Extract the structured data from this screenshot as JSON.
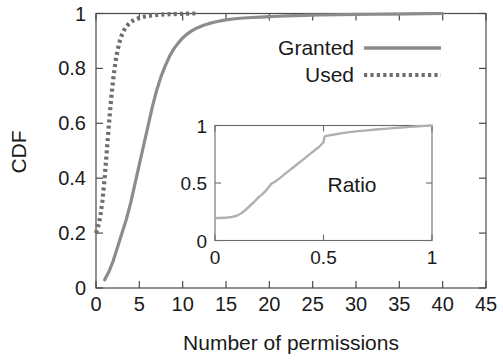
{
  "chart_data": {
    "type": "line",
    "title": "",
    "xlabel": "Number of permissions",
    "ylabel": "CDF",
    "xlim": [
      0,
      45
    ],
    "ylim": [
      0,
      1
    ],
    "xticks": [
      "0",
      "5",
      "10",
      "15",
      "20",
      "25",
      "30",
      "35",
      "40",
      "45"
    ],
    "xtick_values": [
      0,
      5,
      10,
      15,
      20,
      25,
      30,
      35,
      40,
      45
    ],
    "yticks": [
      "0",
      "0.2",
      "0.4",
      "0.6",
      "0.8",
      "1"
    ],
    "ytick_values": [
      0,
      0.2,
      0.4,
      0.6,
      0.8,
      1
    ],
    "grid": false,
    "legend_position": "upper right",
    "series": [
      {
        "name": "Granted",
        "style": "solid",
        "color": "#8c8c8c",
        "x": [
          1,
          1.5,
          2,
          2.5,
          3,
          3.5,
          4,
          4.5,
          5,
          5.5,
          6,
          6.5,
          7,
          7.5,
          8,
          8.5,
          9,
          9.5,
          10,
          10.5,
          11,
          11.5,
          12,
          12.5,
          13,
          13.5,
          14,
          14.5,
          15,
          16,
          17,
          18,
          19,
          20,
          21,
          22,
          23,
          24,
          25,
          26,
          28,
          30,
          32,
          34,
          36,
          38,
          40
        ],
        "y": [
          0.03,
          0.06,
          0.1,
          0.15,
          0.2,
          0.25,
          0.31,
          0.38,
          0.45,
          0.52,
          0.59,
          0.66,
          0.72,
          0.77,
          0.81,
          0.845,
          0.872,
          0.893,
          0.911,
          0.925,
          0.936,
          0.945,
          0.952,
          0.958,
          0.963,
          0.967,
          0.971,
          0.974,
          0.977,
          0.981,
          0.9835,
          0.9855,
          0.987,
          0.9885,
          0.99,
          0.991,
          0.992,
          0.993,
          0.9938,
          0.9945,
          0.9955,
          0.9965,
          0.9972,
          0.998,
          0.9987,
          0.9993,
          1.0
        ]
      },
      {
        "name": "Used",
        "style": "dotted",
        "color": "#6e6e6e",
        "x": [
          0,
          0.25,
          0.5,
          0.75,
          1,
          1.25,
          1.5,
          1.75,
          2,
          2.25,
          2.5,
          2.75,
          3,
          3.25,
          3.5,
          3.75,
          4,
          4.25,
          4.5,
          5,
          5.5,
          6,
          6.5,
          7,
          7.5,
          8,
          8.5,
          9,
          9.5,
          10,
          10.5,
          11,
          11.5
        ],
        "y": [
          0.2,
          0.225,
          0.26,
          0.32,
          0.4,
          0.5,
          0.6,
          0.69,
          0.765,
          0.825,
          0.868,
          0.9,
          0.924,
          0.94,
          0.952,
          0.961,
          0.968,
          0.974,
          0.978,
          0.984,
          0.988,
          0.991,
          0.993,
          0.9945,
          0.996,
          0.9968,
          0.9975,
          0.998,
          0.9985,
          0.999,
          0.9995,
          1.0,
          1.0
        ]
      }
    ],
    "inset": {
      "type": "line",
      "title": "Ratio",
      "xlim": [
        0,
        1
      ],
      "ylim": [
        0,
        1
      ],
      "xticks": [
        "0",
        "0.5",
        "1"
      ],
      "xtick_values": [
        0,
        0.5,
        1
      ],
      "yticks": [
        "0",
        "0.5",
        "1"
      ],
      "ytick_values": [
        0,
        0.5,
        1
      ],
      "grid": false,
      "series": [
        {
          "name": "Ratio",
          "style": "solid",
          "color": "#b0b0b0",
          "x": [
            0.0,
            0.02,
            0.04,
            0.06,
            0.08,
            0.1,
            0.12,
            0.14,
            0.16,
            0.18,
            0.2,
            0.22,
            0.24,
            0.25,
            0.26,
            0.28,
            0.3,
            0.32,
            0.34,
            0.36,
            0.38,
            0.4,
            0.42,
            0.44,
            0.46,
            0.48,
            0.49,
            0.5,
            0.505,
            0.52,
            0.55,
            0.58,
            0.62,
            0.66,
            0.7,
            0.74,
            0.78,
            0.82,
            0.86,
            0.9,
            0.94,
            0.97,
            1.0
          ],
          "y": [
            0.195,
            0.196,
            0.198,
            0.2,
            0.205,
            0.215,
            0.235,
            0.265,
            0.3,
            0.335,
            0.375,
            0.405,
            0.445,
            0.47,
            0.495,
            0.515,
            0.545,
            0.575,
            0.605,
            0.635,
            0.665,
            0.695,
            0.725,
            0.755,
            0.785,
            0.815,
            0.835,
            0.855,
            0.905,
            0.912,
            0.922,
            0.932,
            0.942,
            0.951,
            0.958,
            0.965,
            0.971,
            0.977,
            0.982,
            0.988,
            0.993,
            0.997,
            1.0
          ]
        }
      ]
    }
  },
  "legend": {
    "items": [
      {
        "label": "Granted",
        "style": "solid"
      },
      {
        "label": "Used",
        "style": "dotted"
      }
    ]
  },
  "colors": {
    "granted": "#8c8c8c",
    "used": "#6e6e6e",
    "ratio": "#b0b0b0",
    "axis": "#4a4a4a",
    "text": "#1a1a1a",
    "background": "#ffffff"
  }
}
